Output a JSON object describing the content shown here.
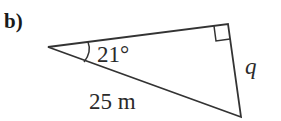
{
  "part_label": "b)",
  "diagram": {
    "type": "right-triangle",
    "vertices": {
      "apex": [
        48,
        47
      ],
      "right_angle": [
        228,
        24
      ],
      "bottom": [
        241,
        117
      ]
    },
    "angle_label": "21°",
    "hypotenuse_label": "25 m",
    "opposite_label": "q",
    "line_color": "#333333"
  }
}
